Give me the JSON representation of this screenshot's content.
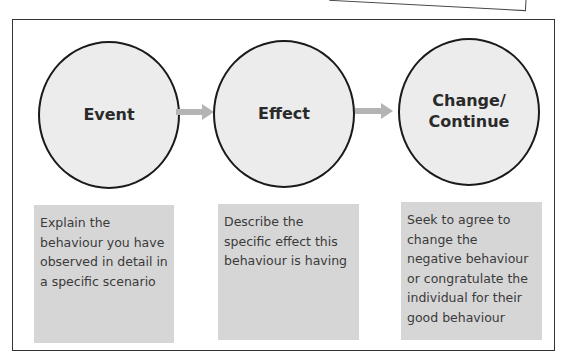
{
  "diagram": {
    "type": "process-flow",
    "steps": [
      {
        "title_lines": [
          "Event"
        ],
        "description": "Explain the behaviour you have observed in detail in a specific scenario"
      },
      {
        "title_lines": [
          "Effect"
        ],
        "description": "Describe the specific effect this behaviour is having"
      },
      {
        "title_lines": [
          "Change/",
          "Continue"
        ],
        "description": "Seek to agree to change the negative behaviour or congratulate the individual for their good behaviour"
      }
    ],
    "connectors": [
      {
        "from": "Event",
        "to": "Effect",
        "icon": "arrow-right-icon"
      },
      {
        "from": "Effect",
        "to": "Change/Continue",
        "icon": "arrow-right-icon"
      }
    ],
    "colors": {
      "circle_fill": "#ececec",
      "circle_stroke": "#1a1a1a",
      "box_fill": "#d6d6d6",
      "arrow_fill": "#b4b4b4",
      "frame_stroke": "#333333"
    }
  }
}
